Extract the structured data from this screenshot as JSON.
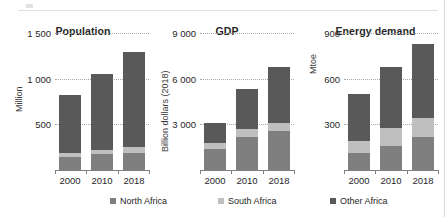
{
  "figure": {
    "series": [
      {
        "key": "north",
        "label": "North Africa",
        "color": "#7f7f7f"
      },
      {
        "key": "south",
        "label": "South Africa",
        "color": "#bfbfbf"
      },
      {
        "key": "other",
        "label": "Other Africa",
        "color": "#595959"
      }
    ],
    "categories": [
      "2000",
      "2010",
      "2018"
    ]
  },
  "chart_data": [
    {
      "type": "bar",
      "title": "Population",
      "ylabel": "Million",
      "xlabel": "",
      "categories": [
        "2000",
        "2010",
        "2018"
      ],
      "ylim": [
        0,
        1500
      ],
      "yticks": [
        500,
        1000,
        1500
      ],
      "ytick_labels": [
        "500",
        "1 000",
        "1 500"
      ],
      "grid": true,
      "stacked": true,
      "legend": "bottom",
      "series": [
        {
          "name": "North Africa",
          "values": [
            143,
            170,
            190
          ]
        },
        {
          "name": "South Africa",
          "values": [
            45,
            51,
            58
          ]
        },
        {
          "name": "Other Africa",
          "values": [
            632,
            829,
            1042
          ]
        }
      ],
      "totals": [
        820,
        1050,
        1290
      ]
    },
    {
      "type": "bar",
      "title": "GDP",
      "ylabel": "Billion dollars (2018)",
      "xlabel": "",
      "categories": [
        "2000",
        "2010",
        "2018"
      ],
      "ylim": [
        0,
        9000
      ],
      "yticks": [
        3000,
        6000,
        9000
      ],
      "ytick_labels": [
        "3 000",
        "6 000",
        "9 000"
      ],
      "grid": true,
      "stacked": true,
      "legend": "bottom",
      "series": [
        {
          "name": "North Africa",
          "values": [
            1400,
            2200,
            2550
          ]
        },
        {
          "name": "South Africa",
          "values": [
            400,
            500,
            550
          ]
        },
        {
          "name": "Other Africa",
          "values": [
            1300,
            2600,
            3700
          ]
        }
      ],
      "totals": [
        3100,
        5300,
        6800
      ]
    },
    {
      "type": "bar",
      "title": "Energy demand",
      "ylabel": "Mtoe",
      "xlabel": "",
      "categories": [
        "2000",
        "2010",
        "2018"
      ],
      "ylim": [
        0,
        900
      ],
      "yticks": [
        300,
        600,
        900
      ],
      "ytick_labels": [
        "300",
        "600",
        "900"
      ],
      "grid": true,
      "stacked": true,
      "legend": "bottom",
      "series": [
        {
          "name": "North Africa",
          "values": [
            110,
            160,
            215
          ]
        },
        {
          "name": "South Africa",
          "values": [
            80,
            115,
            125
          ]
        },
        {
          "name": "Other Africa",
          "values": [
            310,
            405,
            490
          ]
        }
      ],
      "totals": [
        500,
        680,
        830
      ]
    }
  ]
}
